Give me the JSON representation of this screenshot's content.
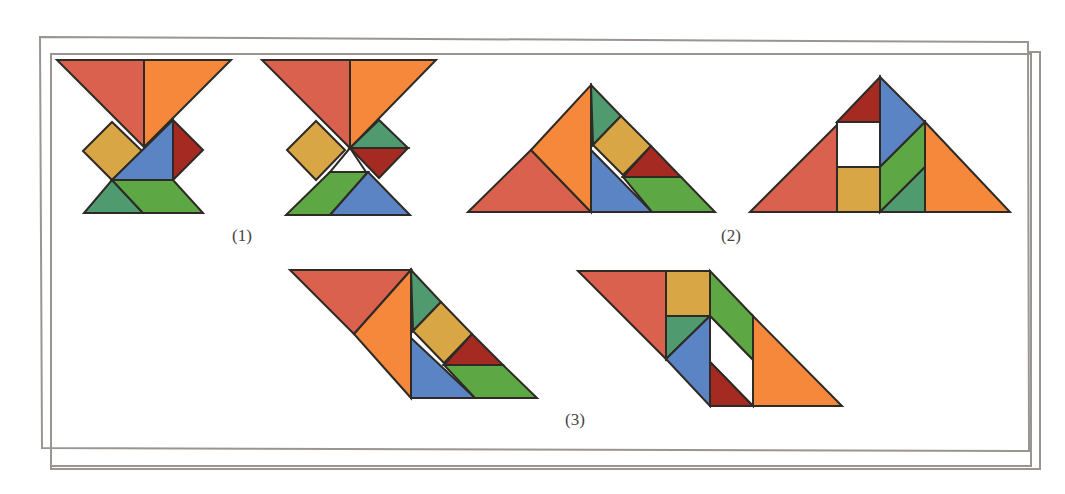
{
  "figure": {
    "colors": {
      "red": "#D9614E",
      "orange": "#F5883A",
      "yellow": "#D9A645",
      "blue": "#5B84C4",
      "darkred": "#A52A22",
      "green": "#5DA845",
      "teal": "#4F9A6E",
      "gap": "#FFFFFF",
      "stroke": "#2E2A26",
      "frame": "#9A9590"
    },
    "labels": [
      {
        "text": "(1)",
        "x": 232,
        "y": 226
      },
      {
        "text": "(2)",
        "x": 721,
        "y": 226
      },
      {
        "text": "(3)",
        "x": 565,
        "y": 410
      }
    ],
    "shapes": [
      {
        "group": "1a",
        "color": "red",
        "points": "57,60 144,60 144,147"
      },
      {
        "group": "1a",
        "color": "orange",
        "points": "144,60 231,60 144,147"
      },
      {
        "group": "1a",
        "color": "yellow",
        "points": "83,151 112,122 142,151 112,180"
      },
      {
        "group": "1a",
        "color": "blue",
        "points": "112,180 173,120 173,180"
      },
      {
        "group": "1a",
        "color": "darkred",
        "points": "173,120 203,150 173,180"
      },
      {
        "group": "1a",
        "color": "teal",
        "points": "112,180 143,213 84,213"
      },
      {
        "group": "1a",
        "color": "green",
        "points": "112,180 173,180 203,213 143,213"
      },
      {
        "group": "1b",
        "color": "red",
        "points": "262,60 350,60 350,148"
      },
      {
        "group": "1b",
        "color": "orange",
        "points": "350,60 436,60 350,148"
      },
      {
        "group": "1b",
        "color": "yellow",
        "points": "287,150 316,121 345,150 316,180"
      },
      {
        "group": "1b",
        "color": "teal",
        "points": "350,148 379,120 408,148"
      },
      {
        "group": "1b",
        "color": "darkred",
        "points": "350,148 408,148 379,178"
      },
      {
        "group": "1b",
        "color": "gap",
        "points": "350,148 366,172 330,172"
      },
      {
        "group": "1b",
        "color": "green",
        "points": "330,172 368,172 330,215 286,215"
      },
      {
        "group": "1b",
        "color": "blue",
        "points": "368,172 410,215 330,215"
      },
      {
        "group": "2a",
        "color": "red",
        "points": "468,212 531,150 591,212"
      },
      {
        "group": "2a",
        "color": "orange",
        "points": "531,150 591,85 591,212"
      },
      {
        "group": "2a",
        "color": "teal",
        "points": "591,85 621,116 593,145"
      },
      {
        "group": "2a",
        "color": "yellow",
        "points": "593,145 621,116 651,146 623,175"
      },
      {
        "group": "2a",
        "color": "blue",
        "points": "591,150 652,212 591,212"
      },
      {
        "group": "2a",
        "color": "darkred",
        "points": "651,146 681,177 623,177"
      },
      {
        "group": "2a",
        "color": "green",
        "points": "623,177 681,177 715,212 652,212"
      },
      {
        "group": "2b",
        "color": "red",
        "points": "750,212 837,125 837,212"
      },
      {
        "group": "2b",
        "color": "darkred",
        "points": "837,122 880,77 880,122"
      },
      {
        "group": "2b",
        "color": "gap",
        "points": "837,122 880,122 880,167 837,167"
      },
      {
        "group": "2b",
        "color": "yellow",
        "points": "837,167 880,167 880,212 837,212"
      },
      {
        "group": "2b",
        "color": "blue",
        "points": "880,77 925,122 880,167"
      },
      {
        "group": "2b",
        "color": "green",
        "points": "880,167 925,122 925,167 880,212"
      },
      {
        "group": "2b",
        "color": "teal",
        "points": "880,212 925,167 925,212"
      },
      {
        "group": "2b",
        "color": "orange",
        "points": "925,122 1010,212 925,212"
      },
      {
        "group": "3a",
        "color": "red",
        "points": "290,270 411,270 354,334"
      },
      {
        "group": "3a",
        "color": "orange",
        "points": "354,334 411,270 411,398"
      },
      {
        "group": "3a",
        "color": "teal",
        "points": "411,270 441,302 413,331"
      },
      {
        "group": "3a",
        "color": "yellow",
        "points": "413,331 441,302 472,334 444,363"
      },
      {
        "group": "3a",
        "color": "blue",
        "points": "411,338 475,398 411,398"
      },
      {
        "group": "3a",
        "color": "darkred",
        "points": "472,334 503,365 444,365"
      },
      {
        "group": "3a",
        "color": "green",
        "points": "444,365 503,365 537,398 475,398"
      },
      {
        "group": "3b",
        "color": "red",
        "points": "578,271 666,271 666,359"
      },
      {
        "group": "3b",
        "color": "yellow",
        "points": "666,271 710,271 710,316 666,316"
      },
      {
        "group": "3b",
        "color": "teal",
        "points": "666,316 710,316 666,359"
      },
      {
        "group": "3b",
        "color": "blue",
        "points": "666,359 710,316 710,406"
      },
      {
        "group": "3b",
        "color": "green",
        "points": "710,271 753,316 753,360 710,316"
      },
      {
        "group": "3b",
        "color": "gap",
        "points": "710,316 753,360 753,406 710,362"
      },
      {
        "group": "3b",
        "color": "darkred",
        "points": "710,362 753,406 710,406"
      },
      {
        "group": "3b",
        "color": "orange",
        "points": "753,316 842,406 753,406"
      }
    ]
  }
}
